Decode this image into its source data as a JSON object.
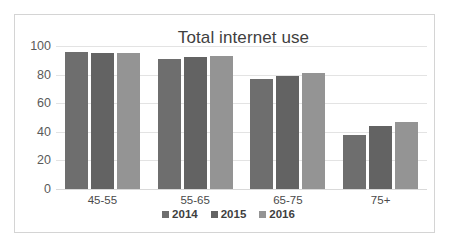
{
  "chart_data": {
    "type": "bar",
    "title": "Total internet use",
    "xlabel": "",
    "ylabel": "",
    "categories": [
      "45-55",
      "55-65",
      "65-75",
      "75+"
    ],
    "ylim": [
      0,
      100
    ],
    "yticks": [
      0,
      20,
      40,
      60,
      80,
      100
    ],
    "ytick_labels": [
      "0",
      "20",
      "40",
      "60",
      "80",
      "100"
    ],
    "grid": true,
    "legend_position": "bottom",
    "series": [
      {
        "name": "2014",
        "color": "#6e6e6e",
        "values": [
          96,
          91,
          77,
          38
        ]
      },
      {
        "name": "2015",
        "color": "#636363",
        "values": [
          95,
          92,
          79,
          44
        ]
      },
      {
        "name": "2016",
        "color": "#949494",
        "values": [
          95,
          93,
          81,
          47
        ]
      }
    ]
  },
  "colors": {
    "frame_border": "#d4d4d4",
    "gridline": "#e3e3e3",
    "title_text": "#3f3f3f",
    "tick_text": "#5a5a5a",
    "background": "#ffffff"
  }
}
